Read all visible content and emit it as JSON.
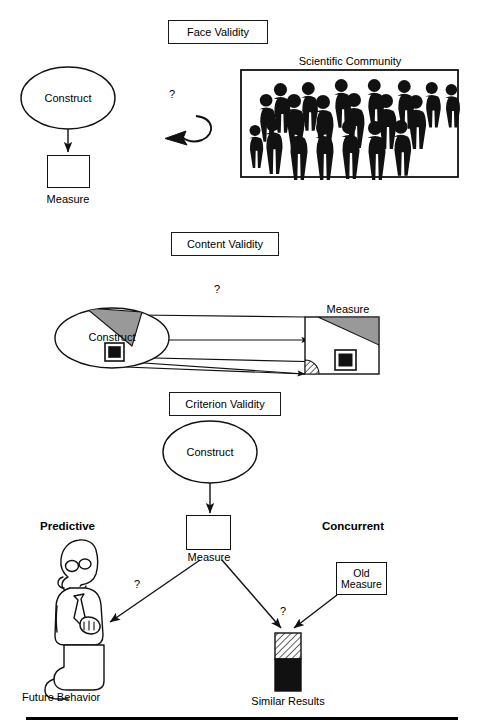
{
  "figure": {
    "background": "#ffffff",
    "line_color": "#111111",
    "shade_gray": "#999999"
  },
  "sections": [
    {
      "id": "face-validity",
      "title": "Face Validity",
      "nodes": {
        "construct_label": "Construct",
        "measure_label": "Measure",
        "community_label": "Scientific Community",
        "question": "?"
      }
    },
    {
      "id": "content-validity",
      "title": "Content Validity",
      "nodes": {
        "construct_label": "Construct",
        "measure_label": "Measure",
        "question": "?"
      }
    },
    {
      "id": "criterion-validity",
      "title": "Criterion Validity",
      "nodes": {
        "construct_label": "Construct",
        "measure_label": "Measure",
        "predictive_label": "Predictive",
        "concurrent_label": "Concurrent",
        "future_behavior_label": "Future Behavior",
        "similar_results_label": "Similar Results",
        "old_measure_label_line1": "Old",
        "old_measure_label_line2": "Measure",
        "question_left": "?",
        "question_right": "?"
      }
    }
  ],
  "icons": {
    "crowd": "crowd-of-people-icon",
    "person": "standing-person-icon",
    "bar": "results-bar-icon"
  }
}
